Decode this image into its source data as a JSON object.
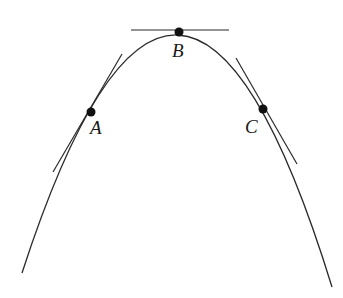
{
  "diagram": {
    "title": "",
    "curve": {
      "type": "parabola-concave-down",
      "path": "M 22 273 Q 179 -210 332 287"
    },
    "points": [
      {
        "label": "A",
        "x": 91,
        "y": 112,
        "label_x": 90,
        "label_y": 134
      },
      {
        "label": "B",
        "x": 179,
        "y": 32,
        "label_x": 172,
        "label_y": 57
      },
      {
        "label": "C",
        "x": 263,
        "y": 109,
        "label_x": 245,
        "label_y": 133
      }
    ],
    "tangents": [
      {
        "at": "A",
        "x1": 122,
        "y1": 54,
        "x2": 53,
        "y2": 172
      },
      {
        "at": "B",
        "x1": 131,
        "y1": 30,
        "x2": 229,
        "y2": 30
      },
      {
        "at": "C",
        "x1": 236,
        "y1": 58,
        "x2": 297,
        "y2": 164
      }
    ],
    "colors": {
      "stroke": "#2a2a2a",
      "point": "#111111",
      "background": "#ffffff"
    }
  }
}
